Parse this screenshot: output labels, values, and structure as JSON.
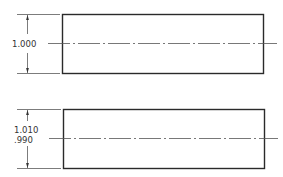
{
  "colors": {
    "outline": "#2a2a2a",
    "thin": "#444444",
    "text": "#333333",
    "background": "#ffffff"
  },
  "views": [
    {
      "id": "basic-dimension",
      "dimension": {
        "text": "1.000"
      }
    },
    {
      "id": "limit-dimension",
      "dimension": {
        "upper": "1.010",
        "lower": ".990"
      }
    }
  ]
}
